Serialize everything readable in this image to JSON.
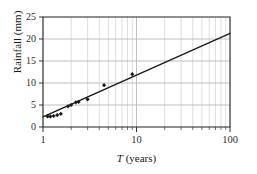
{
  "chart_data": {
    "type": "scatter",
    "title": "",
    "subtitle": "",
    "xlabel": "T (years)",
    "xlabel_italic_part": "T",
    "xlabel_rest": " (years)",
    "ylabel": "Rainfall (mm)",
    "xscale": "log",
    "yscale": "linear",
    "xlim": [
      1,
      100
    ],
    "ylim": [
      0,
      25
    ],
    "xticks": [
      1,
      10,
      100
    ],
    "xtick_labels": [
      "1",
      "10",
      "100"
    ],
    "yticks": [
      0,
      5,
      10,
      15,
      20,
      25
    ],
    "ytick_labels": [
      "0",
      "5",
      "10",
      "15",
      "20",
      "25"
    ],
    "grid": {
      "x_major": true,
      "x_minor": true,
      "y_major": true,
      "y_minor": false,
      "color": "#b8b8b8",
      "minor_color": "#c8c8c8"
    },
    "legend": null,
    "legend_position": "none",
    "series": [
      {
        "name": "Observed rainfall",
        "type": "scatter",
        "marker": "diamond",
        "color": "#1a1a1a",
        "points": [
          {
            "x": 1.12,
            "y": 2.4
          },
          {
            "x": 1.2,
            "y": 2.4
          },
          {
            "x": 1.3,
            "y": 2.5
          },
          {
            "x": 1.42,
            "y": 2.7
          },
          {
            "x": 1.55,
            "y": 3.0
          },
          {
            "x": 1.85,
            "y": 4.7
          },
          {
            "x": 2.0,
            "y": 5.0
          },
          {
            "x": 2.25,
            "y": 5.6
          },
          {
            "x": 2.4,
            "y": 5.7
          },
          {
            "x": 3.0,
            "y": 6.3
          },
          {
            "x": 4.5,
            "y": 9.5
          },
          {
            "x": 9.0,
            "y": 12.0
          }
        ]
      },
      {
        "name": "Fitted line",
        "type": "line",
        "color": "#1a1a1a",
        "width": 1.4,
        "endpoints": [
          {
            "x": 1,
            "y": 2.3
          },
          {
            "x": 100,
            "y": 21.3
          }
        ]
      }
    ]
  },
  "axes": {
    "y_axis_label": "Rainfall (mm)",
    "x_axis_label_italic": "T",
    "x_axis_label_text": " (years)"
  },
  "colors": {
    "background": "#ffffff",
    "frame": "#333333",
    "grid": "#b8b8b8",
    "grid_minor": "#c8c8c8",
    "ink": "#1a1a1a",
    "tick_text": "#2b2b2b"
  }
}
